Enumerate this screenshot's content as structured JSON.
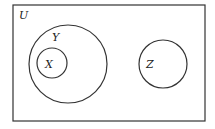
{
  "diagram": {
    "type": "venn",
    "universe": {
      "label": "U",
      "x": 13,
      "y": 5,
      "width": 192,
      "height": 116
    },
    "sets": [
      {
        "id": "Y",
        "label": "Y",
        "cx": 68,
        "cy": 64,
        "r": 39,
        "label_x": 52,
        "label_y": 41
      },
      {
        "id": "X",
        "label": "X",
        "cx": 52,
        "cy": 63,
        "r": 15,
        "label_x": 45,
        "label_y": 68
      },
      {
        "id": "Z",
        "label": "Z",
        "cx": 163,
        "cy": 64,
        "r": 24,
        "label_x": 146,
        "label_y": 68
      }
    ],
    "relations": [
      "X ⊂ Y",
      "Y ∩ Z = ∅"
    ],
    "stroke_color": "#333333"
  }
}
